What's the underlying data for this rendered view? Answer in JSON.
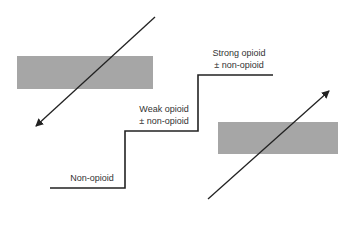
{
  "diagram": {
    "steps": [
      {
        "line1": "Non-opioid",
        "line2": ""
      },
      {
        "line1": "Weak opioid",
        "line2": "± non-opioid"
      },
      {
        "line1": "Strong opioid",
        "line2": "± non-opioid"
      }
    ],
    "colors": {
      "bar": "#a6a6a6",
      "line": "#222222",
      "text": "#333333"
    }
  }
}
